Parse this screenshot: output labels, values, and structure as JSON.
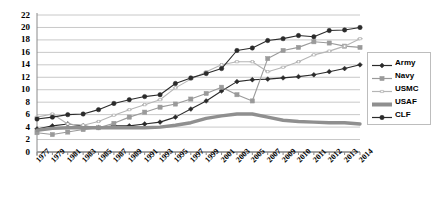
{
  "chart_data": {
    "type": "line",
    "title": "",
    "xlabel": "",
    "ylabel": "",
    "ylim": [
      0,
      22
    ],
    "ytick_step": 2,
    "grid": true,
    "legend_position": "right",
    "yticks": [
      "0",
      "2",
      "4",
      "6",
      "8",
      "10",
      "12",
      "14",
      "16",
      "18",
      "20",
      "22"
    ],
    "categories": [
      "1977",
      "1979",
      "1981",
      "1983",
      "1985",
      "1987",
      "1989",
      "1991",
      "1993",
      "1995",
      "1997",
      "1999",
      "2001",
      "2003",
      "2005",
      "2007",
      "2009",
      "2010",
      "2011",
      "2012",
      "2013",
      "2014"
    ],
    "series": [
      {
        "name": "Army",
        "color": "#2b2b2b",
        "marker": "diamond",
        "values": [
          3.7,
          4.2,
          4.5,
          4.2,
          3.9,
          4.2,
          4.2,
          4.5,
          4.8,
          5.6,
          6.9,
          8.2,
          9.8,
          11.3,
          11.6,
          11.7,
          11.9,
          12.1,
          12.4,
          12.9,
          13.4,
          14.0
        ]
      },
      {
        "name": "Navy",
        "color": "#9a9a9a",
        "marker": "square",
        "values": [
          3.1,
          2.8,
          3.2,
          3.6,
          3.9,
          4.6,
          5.6,
          6.4,
          7.2,
          7.7,
          8.5,
          9.4,
          10.4,
          9.2,
          8.2,
          15.0,
          16.3,
          16.8,
          17.7,
          17.5,
          17.0,
          16.8
        ]
      },
      {
        "name": "USMC",
        "color": "#b5b5b5",
        "marker": "dash",
        "values": [
          5.6,
          6.1,
          4.5,
          4.3,
          4.9,
          5.9,
          6.8,
          7.6,
          8.4,
          10.3,
          11.7,
          12.9,
          14.0,
          14.5,
          14.5,
          12.9,
          13.6,
          14.5,
          15.6,
          16.2,
          17.0,
          18.2
        ]
      },
      {
        "name": "USAF",
        "color": "#8f8f8f",
        "marker": "none",
        "values": [
          3.5,
          3.8,
          3.9,
          3.9,
          3.9,
          3.9,
          3.9,
          3.9,
          4.0,
          4.3,
          4.7,
          5.4,
          5.8,
          6.1,
          6.1,
          5.6,
          5.1,
          4.9,
          4.8,
          4.7,
          4.7,
          4.5
        ]
      },
      {
        "name": "CLF",
        "color": "#2b2b2b",
        "marker": "circle",
        "values": [
          5.3,
          5.6,
          6.0,
          6.1,
          6.8,
          7.8,
          8.4,
          8.9,
          9.2,
          11.0,
          11.9,
          12.6,
          13.4,
          16.3,
          16.7,
          17.9,
          18.2,
          18.7,
          18.5,
          19.5,
          19.6,
          20.0
        ]
      }
    ]
  }
}
